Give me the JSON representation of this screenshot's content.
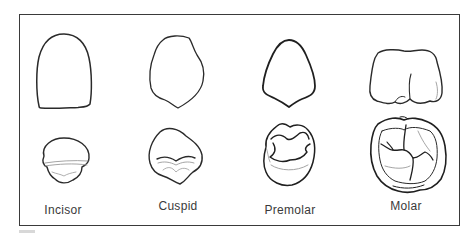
{
  "figure": {
    "type": "tooth-comparison-diagram",
    "rows": [
      "crown-side-view",
      "occlusal-view"
    ],
    "teeth": [
      {
        "id": "incisor",
        "label": "Incisor"
      },
      {
        "id": "cuspid",
        "label": "Cuspid"
      },
      {
        "id": "premolar",
        "label": "Premolar"
      },
      {
        "id": "molar",
        "label": "Molar"
      }
    ]
  },
  "colors": {
    "outline": "#2a2a2a",
    "detail": "#9a9a9a",
    "frame": "#3a3a3a",
    "label": "#3a3a3a"
  }
}
